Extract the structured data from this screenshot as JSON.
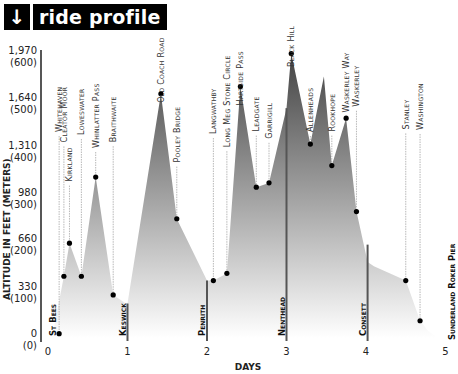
{
  "title": {
    "icon": "arrow-down-icon",
    "icon_glyph": "🡻",
    "text": "ride profile"
  },
  "colors": {
    "fill_dark": "#555555",
    "fill_light": "#ffffff",
    "marker": "#000000",
    "title_bg": "#000000"
  },
  "chart_data": {
    "type": "area",
    "title": "ride profile",
    "xlabel": "DAYS",
    "ylabel": "ALTITUDE IN FEET (METERS)",
    "xlim": [
      0,
      5
    ],
    "ylim": [
      0,
      1970
    ],
    "x_ticks": [
      "0",
      "1",
      "2",
      "3",
      "4",
      "5"
    ],
    "y_ticks": [
      {
        "feet": "0",
        "meters": "(0)",
        "value": 0
      },
      {
        "feet": "330",
        "meters": "(100)",
        "value": 330
      },
      {
        "feet": "660",
        "meters": "(200)",
        "value": 660
      },
      {
        "feet": "980",
        "meters": "(300)",
        "value": 980
      },
      {
        "feet": "1,310",
        "meters": "(400)",
        "value": 1310
      },
      {
        "feet": "1,640",
        "meters": "(500)",
        "value": 1640
      },
      {
        "feet": "1,970",
        "meters": "(600)",
        "value": 1970
      }
    ],
    "profile": [
      [
        0.05,
        0
      ],
      [
        0.2,
        430
      ],
      [
        0.27,
        660
      ],
      [
        0.42,
        430
      ],
      [
        0.6,
        1120
      ],
      [
        0.82,
        300
      ],
      [
        0.98,
        240
      ],
      [
        1.0,
        240
      ],
      [
        1.42,
        1700
      ],
      [
        1.62,
        830
      ],
      [
        2.0,
        400
      ],
      [
        2.08,
        400
      ],
      [
        2.25,
        450
      ],
      [
        2.42,
        1750
      ],
      [
        2.62,
        1050
      ],
      [
        2.78,
        1080
      ],
      [
        3.0,
        1600
      ],
      [
        3.06,
        1980
      ],
      [
        3.3,
        1350
      ],
      [
        3.47,
        1820
      ],
      [
        3.57,
        1200
      ],
      [
        3.75,
        1530
      ],
      [
        3.88,
        880
      ],
      [
        4.02,
        530
      ],
      [
        4.1,
        500
      ],
      [
        4.5,
        400
      ],
      [
        4.68,
        120
      ],
      [
        4.78,
        50
      ],
      [
        4.9,
        0
      ]
    ],
    "waypoints": [
      {
        "name": "Whitehaven",
        "x": 0.14,
        "y": 30
      },
      {
        "name": "Cleator Moor",
        "x": 0.2,
        "y": 430
      },
      {
        "name": "Kirkland",
        "x": 0.27,
        "y": 660
      },
      {
        "name": "Loweswater",
        "x": 0.42,
        "y": 430
      },
      {
        "name": "Whinlatter Pass",
        "x": 0.6,
        "y": 1120
      },
      {
        "name": "Braithwaite",
        "x": 0.82,
        "y": 300
      },
      {
        "name": "Old Coach Road",
        "x": 1.42,
        "y": 1700
      },
      {
        "name": "Pooley Bridge",
        "x": 1.62,
        "y": 830
      },
      {
        "name": "Langwathby",
        "x": 2.08,
        "y": 400
      },
      {
        "name": "Long Meg Stone Circle",
        "x": 2.25,
        "y": 450
      },
      {
        "name": "Hartside Pass",
        "x": 2.42,
        "y": 1750
      },
      {
        "name": "Leadgate",
        "x": 2.62,
        "y": 1050
      },
      {
        "name": "Garrigill",
        "x": 2.78,
        "y": 1080
      },
      {
        "name": "Black Hill",
        "x": 3.06,
        "y": 1980
      },
      {
        "name": "Allenheads",
        "x": 3.3,
        "y": 1350
      },
      {
        "name": "Rookhope",
        "x": 3.57,
        "y": 1200
      },
      {
        "name": "Waskerley Way",
        "x": 3.75,
        "y": 1530
      },
      {
        "name": "Waskerley",
        "x": 3.88,
        "y": 880
      },
      {
        "name": "Stanley",
        "x": 4.5,
        "y": 400
      },
      {
        "name": "Washington",
        "x": 4.68,
        "y": 120
      }
    ],
    "towns": [
      {
        "name": "St Bees",
        "x": 0.0,
        "bar_top": 0
      },
      {
        "name": "Keswick",
        "x": 1.0,
        "bar_top": 240
      },
      {
        "name": "Penrith",
        "x": 2.0,
        "bar_top": 400
      },
      {
        "name": "Nenthead",
        "x": 3.0,
        "bar_top": 1600
      },
      {
        "name": "Consett",
        "x": 4.02,
        "bar_top": 650
      },
      {
        "name": "Sunderland Roker Pier",
        "x": 5.0,
        "bar_top": 0
      }
    ]
  }
}
